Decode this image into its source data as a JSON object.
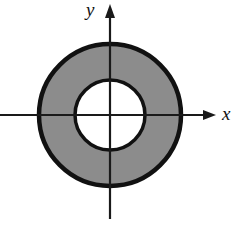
{
  "figure": {
    "background_color": "#ffffff",
    "width": 232,
    "height": 226
  },
  "axes": {
    "origin": {
      "x": 110,
      "y": 115
    },
    "color": "#1a1a1a",
    "x_axis": {
      "name": "x-axis",
      "label": "x",
      "label_x": 222,
      "label_y": 120,
      "start_x": 0,
      "end_x": 216,
      "y": 115,
      "arrow": "right"
    },
    "y_axis": {
      "name": "y-axis",
      "label": "y",
      "label_x": 86,
      "label_y": 16,
      "start_y": 219,
      "end_y": 5,
      "x": 110,
      "arrow": "up"
    }
  },
  "shapes": {
    "outer_circle": {
      "name": "outer-circle",
      "cx": 110,
      "cy": 115,
      "r": 71,
      "fill": "#8c8c8c",
      "stroke": "#111111",
      "stroke_width": 4.5
    },
    "inner_circle": {
      "name": "inner-circle",
      "cx": 110,
      "cy": 115,
      "r": 35,
      "fill": "#ffffff",
      "stroke": "#111111",
      "stroke_width": 3.5
    }
  },
  "colors": {
    "shaded_region": "#8c8c8c",
    "outline": "#111111",
    "hole": "#ffffff",
    "axis": "#1a1a1a"
  }
}
